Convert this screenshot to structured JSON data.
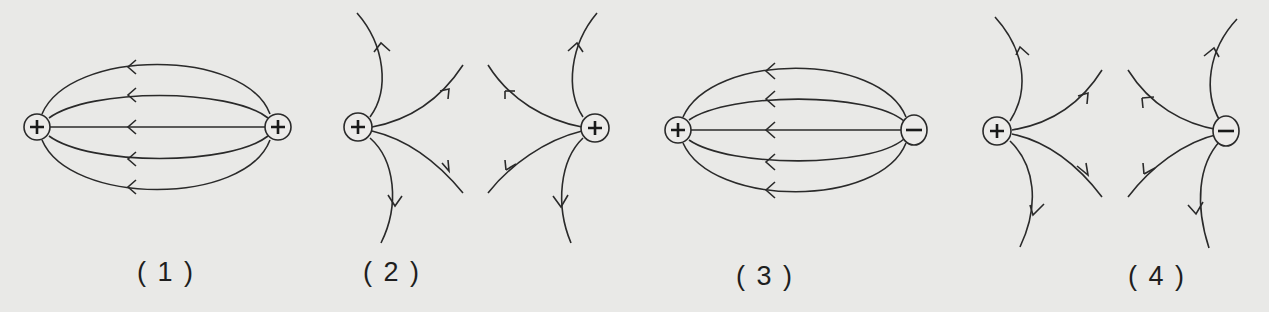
{
  "figure": {
    "background": "#e9e9e7",
    "line_color": "#2a2a2a",
    "panels": [
      {
        "label": "( 1 )",
        "left_charge": "+",
        "right_charge": "+",
        "pattern": "closed arcs between charges, arrows pointing left"
      },
      {
        "label": "( 2 )",
        "left_charge": "+",
        "right_charge": "+",
        "pattern": "lines diverging outward from each charge, repelling"
      },
      {
        "label": "( 3 )",
        "left_charge": "+",
        "right_charge": "−",
        "pattern": "closed arcs between charges, arrows pointing left"
      },
      {
        "label": "( 4 )",
        "left_charge": "+",
        "right_charge": "−",
        "pattern": "lines diverging outward from each charge"
      }
    ]
  }
}
